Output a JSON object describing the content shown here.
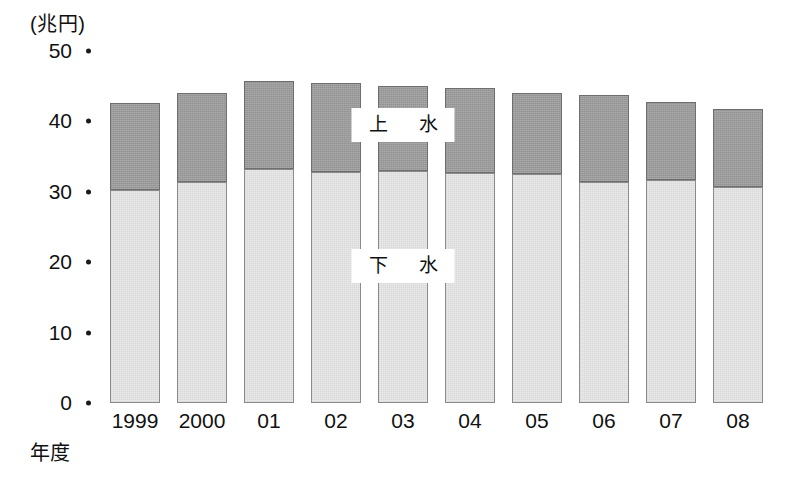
{
  "chart_data": {
    "type": "bar",
    "subtype": "stacked-bar",
    "title": "",
    "unit_caption": "(兆円)",
    "xlabel": "年度",
    "ylabel": "",
    "ylim": [
      0,
      50
    ],
    "y_ticks": [
      0,
      10,
      20,
      30,
      40,
      50
    ],
    "y_tick_labels": [
      "0",
      "10",
      "20",
      "30",
      "40",
      "50"
    ],
    "grid": false,
    "legend_position": "in-plot",
    "categories": [
      "1999",
      "2000",
      "01",
      "02",
      "03",
      "04",
      "05",
      "06",
      "07",
      "08"
    ],
    "series": [
      {
        "name": "下　水",
        "label_short": "下水",
        "color": "#e9e9e9",
        "values": [
          30.2,
          31.4,
          33.2,
          32.8,
          33.0,
          32.7,
          32.5,
          31.4,
          31.7,
          30.7
        ]
      },
      {
        "name": "上　水",
        "label_short": "上水",
        "color": "#9b9b9b",
        "values": [
          12.4,
          12.7,
          12.5,
          12.6,
          12.0,
          12.1,
          11.6,
          12.4,
          11.0,
          11.0
        ]
      }
    ],
    "totals": [
      42.6,
      44.1,
      45.7,
      45.4,
      45.0,
      44.8,
      44.1,
      43.8,
      42.7,
      41.7
    ],
    "annotations": [
      {
        "text": "上　水",
        "series": "上水",
        "x_category": "03",
        "value_position": 39.5
      },
      {
        "text": "下　水",
        "series": "下水",
        "x_category": "03",
        "value_position": 19.5
      }
    ]
  },
  "geometry": {
    "baseline_y": 403,
    "value_top_y": 51,
    "bar_left_first": 110,
    "bar_width": 50,
    "bar_pitch": 67,
    "y_axis_label_right": 72,
    "y_tick_dot_x": 86
  }
}
